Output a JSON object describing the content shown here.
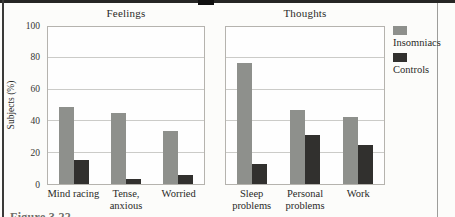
{
  "figure": {
    "caption_fragment": "Figure 3.22"
  },
  "colors": {
    "insomniacs": "#8e908c",
    "controls": "#31302e",
    "gridline": "#cbcbc8",
    "panel_border": "#b5b3ae"
  },
  "chart_data": {
    "type": "bar",
    "title": "",
    "ylabel": "Subjects (%)",
    "ylim": [
      0,
      100
    ],
    "yticks": [
      0,
      20,
      40,
      60,
      80,
      100
    ],
    "grid": true,
    "legend": {
      "position": "right",
      "entries": [
        {
          "label": "Insomniacs",
          "color": "#8e908c"
        },
        {
          "label": "Controls",
          "color": "#31302e"
        }
      ]
    },
    "panels": [
      {
        "title": "Feelings",
        "categories": [
          "Mind racing",
          "Tense, anxious",
          "Worried"
        ],
        "series": [
          {
            "name": "Insomniacs",
            "values": [
              49,
              45,
              34
            ]
          },
          {
            "name": "Controls",
            "values": [
              15,
              3,
              6
            ]
          }
        ]
      },
      {
        "title": "Thoughts",
        "categories": [
          "Sleep problems",
          "Personal problems",
          "Work"
        ],
        "series": [
          {
            "name": "Insomniacs",
            "values": [
              77,
              47,
              43
            ]
          },
          {
            "name": "Controls",
            "values": [
              13,
              31,
              25
            ]
          }
        ]
      }
    ]
  }
}
